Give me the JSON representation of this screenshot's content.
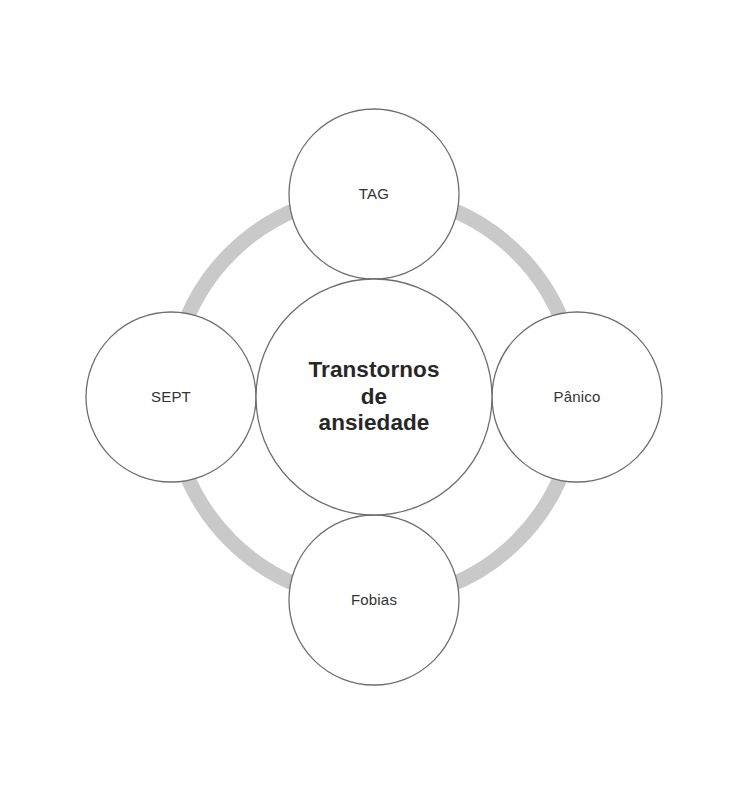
{
  "diagram": {
    "type": "hub-and-spoke-ring",
    "title": "Transtornos de ansiedade",
    "canvas": {
      "width": 754,
      "height": 785,
      "background": "#ffffff"
    },
    "colors": {
      "ring": "#c9c9c9",
      "circle_fill": "#ffffff",
      "circle_stroke": "#6e6e6e",
      "center_text": "#272727",
      "satellite_text": "#333333"
    },
    "center": {
      "id": "center-node",
      "name": "transtornos-de-ansiedade",
      "label": "Transtornos\nde\nansiedade",
      "label_lines": [
        "Transtornos",
        "de",
        "ansiedade"
      ],
      "cx": 374,
      "cy": 397,
      "r": 118
    },
    "ring": {
      "name": "connector-ring",
      "cx": 374,
      "cy": 397,
      "radius": 203,
      "stroke_width": 15,
      "color": "#c9c9c9"
    },
    "nodes": [
      {
        "id": "node-tag",
        "name": "tag",
        "label": "TAG",
        "position": "top",
        "cx": 374,
        "cy": 194,
        "r": 85,
        "angle_deg": 270
      },
      {
        "id": "node-panico",
        "name": "panico",
        "label": "Pânico",
        "position": "right",
        "cx": 577,
        "cy": 397,
        "r": 85,
        "angle_deg": 0
      },
      {
        "id": "node-fobias",
        "name": "fobias",
        "label": "Fobias",
        "position": "bottom",
        "cx": 374,
        "cy": 600,
        "r": 85,
        "angle_deg": 90
      },
      {
        "id": "node-sept",
        "name": "sept",
        "label": "SEPT",
        "position": "left",
        "cx": 171,
        "cy": 397,
        "r": 85,
        "angle_deg": 180
      }
    ]
  }
}
